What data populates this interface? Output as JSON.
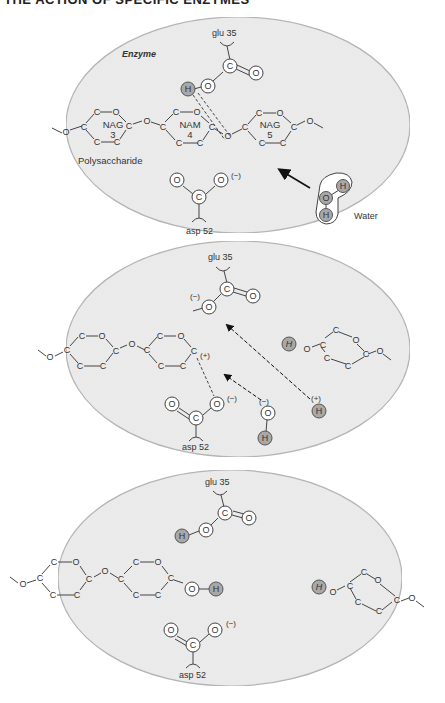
{
  "header": {
    "title": "THE ACTION OF SPECIFIC ENZYMES"
  },
  "colors": {
    "enzyme_fill": "#ececec",
    "enzyme_stroke": "#b4b4b4",
    "h_atom_fill": "#a8a8a8",
    "line": "#444444",
    "text": "#333333"
  },
  "panels": [
    {
      "id": "panel-1",
      "enzyme_label": "Enzyme",
      "glu_label": "glu 35",
      "asp_label": "asp 52",
      "sugars": [
        {
          "name": "NAG",
          "number": "3"
        },
        {
          "name": "NAM",
          "number": "4"
        },
        {
          "name": "NAG",
          "number": "5"
        }
      ],
      "polysaccharide_label": "Polysaccharide",
      "water_label": "Water",
      "asp_charge": "(−)",
      "atoms": {
        "C": "C",
        "O": "O",
        "H": "H"
      }
    },
    {
      "id": "panel-2",
      "glu_label": "glu 35",
      "asp_label": "asp 52",
      "glu_charge": "(−)",
      "carbocation_charge": "(+)",
      "asp_charge": "(−)",
      "hydroxide_charge": "(−)",
      "proton_charge": "(+)",
      "atoms": {
        "C": "C",
        "O": "O",
        "H": "H"
      }
    },
    {
      "id": "panel-3",
      "glu_label": "glu 35",
      "asp_label": "asp 52",
      "asp_charge": "(−)",
      "atoms": {
        "C": "C",
        "O": "O",
        "H": "H"
      }
    }
  ]
}
